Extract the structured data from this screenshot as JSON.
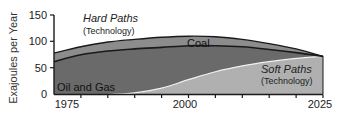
{
  "chart_data": {
    "type": "area",
    "title": "",
    "xlabel": "",
    "ylabel": "Exajoules per Year",
    "xlim": [
      1975,
      2025
    ],
    "ylim": [
      0,
      150
    ],
    "x_ticks": [
      1975,
      2000,
      2025
    ],
    "y_ticks": [
      0,
      50,
      100,
      150
    ],
    "x_minor_tick_step": 5,
    "grid": false,
    "series": [
      {
        "name": "Oil and Gas",
        "group": "Hard Paths (Technology)",
        "x": [
          1975,
          1980,
          1985,
          1990,
          1995,
          2000,
          2005,
          2010,
          2015,
          2020,
          2025
        ],
        "values": [
          62,
          75,
          82,
          86,
          89,
          92,
          92,
          90,
          85,
          79,
          72
        ],
        "color": "#6a6a6a"
      },
      {
        "name": "Coal",
        "group": "Hard Paths (Technology)",
        "x": [
          1975,
          1980,
          1985,
          1990,
          1995,
          2000,
          2005,
          2010,
          2015,
          2020,
          2025
        ],
        "values_top": [
          78,
          90,
          99,
          104,
          108,
          110,
          109,
          104,
          96,
          86,
          72
        ],
        "color": "#8c8c8c"
      },
      {
        "name": "Soft Paths (Technology)",
        "x": [
          1975,
          1980,
          1985,
          1990,
          1995,
          2000,
          2005,
          2010,
          2015,
          2020,
          2025
        ],
        "values": [
          0,
          0,
          0,
          3,
          12,
          28,
          43,
          54,
          62,
          68,
          72
        ],
        "color": "#b0b0b0"
      }
    ],
    "annotations": [
      {
        "text": "Hard Paths",
        "style": "italic"
      },
      {
        "text": "(Technology)"
      },
      {
        "text": "Coal"
      },
      {
        "text": "Oil and Gas"
      },
      {
        "text": "Soft Paths",
        "style": "italic"
      },
      {
        "text": "(Technology)"
      }
    ]
  },
  "labels": {
    "ylabel": "Exajoules per Year",
    "y150": "150",
    "y100": "100",
    "y50": "50",
    "y0": "0",
    "x1975": "1975",
    "x2000": "2000",
    "x2025": "2025",
    "hard_title": "Hard Paths",
    "hard_sub": "(Technology)",
    "coal": "Coal",
    "oil_gas": "Oil and Gas",
    "soft_title": "Soft Paths",
    "soft_sub": "(Technology)"
  }
}
